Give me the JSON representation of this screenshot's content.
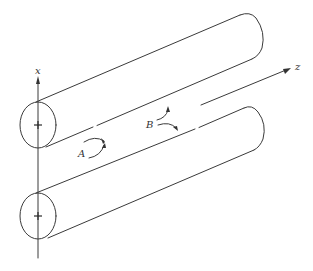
{
  "diagram": {
    "axes": {
      "x_label": "x",
      "z_label": "z"
    },
    "conductors": [
      {
        "name": "upper-conductor",
        "polarity": "+"
      },
      {
        "name": "lower-conductor",
        "polarity": "+"
      }
    ],
    "points": {
      "A_label": "A",
      "B_label": "B"
    },
    "colors": {
      "line": "#3a3a3a",
      "background": "#ffffff"
    }
  }
}
